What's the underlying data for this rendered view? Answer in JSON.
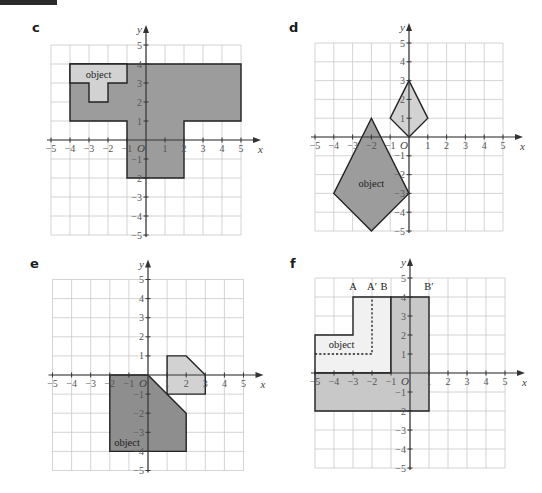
{
  "colors": {
    "grid": "#c9c9c9",
    "axis": "#333333",
    "outline": "#222222",
    "fill_light": "#d2d2d2",
    "fill_dark": "#9c9c9c",
    "fill_darker": "#8e8e8e",
    "fill_mid": "#c8c8c8",
    "fill_pale": "#f1f1f1"
  },
  "axis": {
    "x_name": "x",
    "y_name": "y",
    "origin_label": "O",
    "range": [
      -5,
      5
    ],
    "ticks": [
      -5,
      -4,
      -3,
      -2,
      -1,
      1,
      2,
      3,
      4,
      5
    ]
  },
  "panels": [
    {
      "id": "c",
      "label": "c",
      "label_pos": [
        32,
        21
      ],
      "origin_px": [
        146,
        140
      ],
      "unit_px": 19,
      "shapes": [
        {
          "name": "image",
          "fill": "fill_dark",
          "points": [
            [
              -4,
              4
            ],
            [
              5,
              4
            ],
            [
              5,
              1
            ],
            [
              2,
              1
            ],
            [
              2,
              -2
            ],
            [
              -1,
              -2
            ],
            [
              -1,
              1
            ],
            [
              -4,
              1
            ]
          ]
        },
        {
          "name": "object",
          "fill": "fill_light",
          "points": [
            [
              -4,
              4
            ],
            [
              -1,
              4
            ],
            [
              -1,
              3
            ],
            [
              -2,
              3
            ],
            [
              -2,
              2
            ],
            [
              -3,
              2
            ],
            [
              -3,
              3
            ],
            [
              -4,
              3
            ]
          ]
        }
      ],
      "dashed": [],
      "texts": [
        {
          "text": "object",
          "at": [
            -2.5,
            3.45
          ]
        }
      ],
      "point_labels": []
    },
    {
      "id": "d",
      "label": "d",
      "label_pos": [
        289,
        21
      ],
      "origin_px": [
        409,
        137
      ],
      "unit_px": 18.8,
      "shapes": [
        {
          "name": "object",
          "fill": "fill_dark",
          "points": [
            [
              -2,
              1
            ],
            [
              0,
              -3
            ],
            [
              -2,
              -5
            ],
            [
              -4,
              -3
            ]
          ]
        },
        {
          "name": "image",
          "fill": "fill_light",
          "points": [
            [
              0,
              3
            ],
            [
              1,
              1
            ],
            [
              0,
              0
            ],
            [
              -1,
              1
            ]
          ]
        }
      ],
      "dashed": [],
      "texts": [
        {
          "text": "object",
          "at": [
            -2,
            -2.45
          ]
        }
      ],
      "point_labels": []
    },
    {
      "id": "e",
      "label": "e",
      "label_pos": [
        30,
        257
      ],
      "origin_px": [
        148,
        375
      ],
      "unit_px": 19.1,
      "shapes": [
        {
          "name": "object",
          "fill": "fill_darker",
          "points": [
            [
              -2,
              0
            ],
            [
              0,
              0
            ],
            [
              2,
              -2
            ],
            [
              2,
              -4
            ],
            [
              -2,
              -4
            ]
          ]
        },
        {
          "name": "image",
          "fill": "fill_light",
          "points": [
            [
              1,
              1
            ],
            [
              2,
              1
            ],
            [
              3,
              0
            ],
            [
              3,
              -1
            ],
            [
              1,
              -1
            ]
          ]
        }
      ],
      "dashed": [],
      "texts": [
        {
          "text": "object",
          "at": [
            -1.1,
            -3.55
          ]
        }
      ],
      "point_labels": []
    },
    {
      "id": "f",
      "label": "f",
      "label_pos": [
        290,
        257
      ],
      "origin_px": [
        410,
        373
      ],
      "unit_px": 19,
      "shapes": [
        {
          "name": "object",
          "fill": "fill_pale",
          "points": [
            [
              -5,
              0
            ],
            [
              -5,
              2
            ],
            [
              -3,
              2
            ],
            [
              -3,
              4
            ],
            [
              -1,
              4
            ],
            [
              -1,
              0
            ]
          ]
        },
        {
          "name": "image",
          "fill": "fill_mid",
          "points": [
            [
              -1,
              4
            ],
            [
              1,
              4
            ],
            [
              1,
              -2
            ],
            [
              -5,
              -2
            ],
            [
              -5,
              0
            ],
            [
              -1,
              0
            ]
          ]
        }
      ],
      "dashed": [
        [
          [
            -5,
            1
          ],
          [
            -2,
            1
          ],
          [
            -2,
            4
          ]
        ]
      ],
      "texts": [
        {
          "text": "object",
          "at": [
            -3.6,
            1.5
          ]
        }
      ],
      "point_labels": [
        {
          "text": "A",
          "at": [
            -3,
            4.55
          ]
        },
        {
          "text": "A′",
          "at": [
            -2,
            4.55
          ]
        },
        {
          "text": "B",
          "at": [
            -1,
            4.55
          ],
          "dx": -7
        },
        {
          "text": "B′",
          "at": [
            1,
            4.55
          ]
        }
      ]
    }
  ]
}
